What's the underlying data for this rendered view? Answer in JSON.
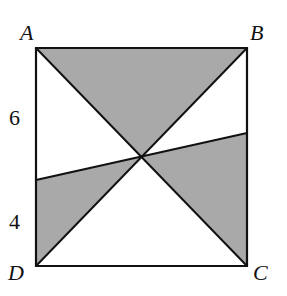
{
  "diagram": {
    "type": "geometry",
    "vertices": {
      "A": {
        "label": "A",
        "x": 36,
        "y": 48
      },
      "B": {
        "label": "B",
        "x": 247,
        "y": 48
      },
      "C": {
        "label": "C",
        "x": 247,
        "y": 266
      },
      "D": {
        "label": "D",
        "x": 36,
        "y": 266
      }
    },
    "center": {
      "x": 141,
      "y": 157
    },
    "transversal": {
      "left": {
        "x": 36,
        "y": 180
      },
      "right": {
        "x": 247,
        "y": 133
      }
    },
    "segment_labels": {
      "upper_left": "6",
      "lower_left": "4"
    },
    "colors": {
      "stroke": "#111111",
      "shade": "#a9a9a9",
      "background": "#ffffff"
    }
  }
}
